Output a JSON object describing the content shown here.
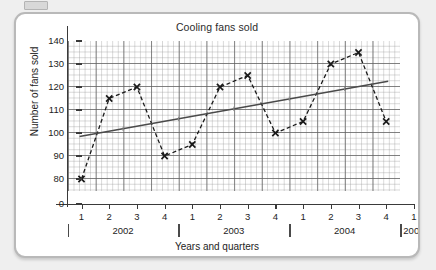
{
  "chart_data": {
    "type": "line",
    "title": "Cooling fans sold",
    "xlabel": "Years and quarters",
    "ylabel": "Number of fans sold",
    "ylim": [
      0,
      140
    ],
    "yticks": [
      0,
      80,
      90,
      100,
      110,
      120,
      130,
      140
    ],
    "ytick_labels": [
      "0",
      "80",
      "90",
      "100",
      "110",
      "120",
      "130",
      "140"
    ],
    "y_axis_break": true,
    "grid": true,
    "legend": "none",
    "quarter_labels": [
      "1",
      "2",
      "3",
      "4",
      "1",
      "2",
      "3",
      "4",
      "1",
      "2",
      "3",
      "4",
      "1"
    ],
    "year_groups": [
      {
        "label": "2002",
        "quarters": [
          "1",
          "2",
          "3",
          "4"
        ]
      },
      {
        "label": "2003",
        "quarters": [
          "1",
          "2",
          "3",
          "4"
        ]
      },
      {
        "label": "2004",
        "quarters": [
          "1",
          "2",
          "3",
          "4"
        ]
      },
      {
        "label": "2005",
        "quarters": [
          "1"
        ]
      }
    ],
    "categories": [
      "2002 Q1",
      "2002 Q2",
      "2002 Q3",
      "2002 Q4",
      "2003 Q1",
      "2003 Q2",
      "2003 Q3",
      "2003 Q4",
      "2004 Q1",
      "2004 Q2",
      "2004 Q3",
      "2004 Q4"
    ],
    "series": [
      {
        "name": "Number of fans sold",
        "marker": "cross",
        "linestyle": "dashed",
        "color": "#1a1a1a",
        "values": [
          80,
          115,
          120,
          90,
          95,
          120,
          125,
          100,
          105,
          130,
          135,
          105
        ]
      },
      {
        "name": "Trend line",
        "marker": "none",
        "linestyle": "solid",
        "color": "#4a4a4a",
        "start_value": 98.5,
        "end_value": 122.5,
        "start_category": "2002 Q1",
        "end_category": "2004 Q4"
      }
    ],
    "colors": {
      "plot_line": "#1a1a1a",
      "trend_line": "#4a4a4a",
      "grid_minor": "#969696",
      "grid_major": "#5f5f5f",
      "axis": "#3a3a3a",
      "text": "#1d1d1d",
      "card_background": "#ffffff",
      "page_background": "#efefef"
    }
  }
}
